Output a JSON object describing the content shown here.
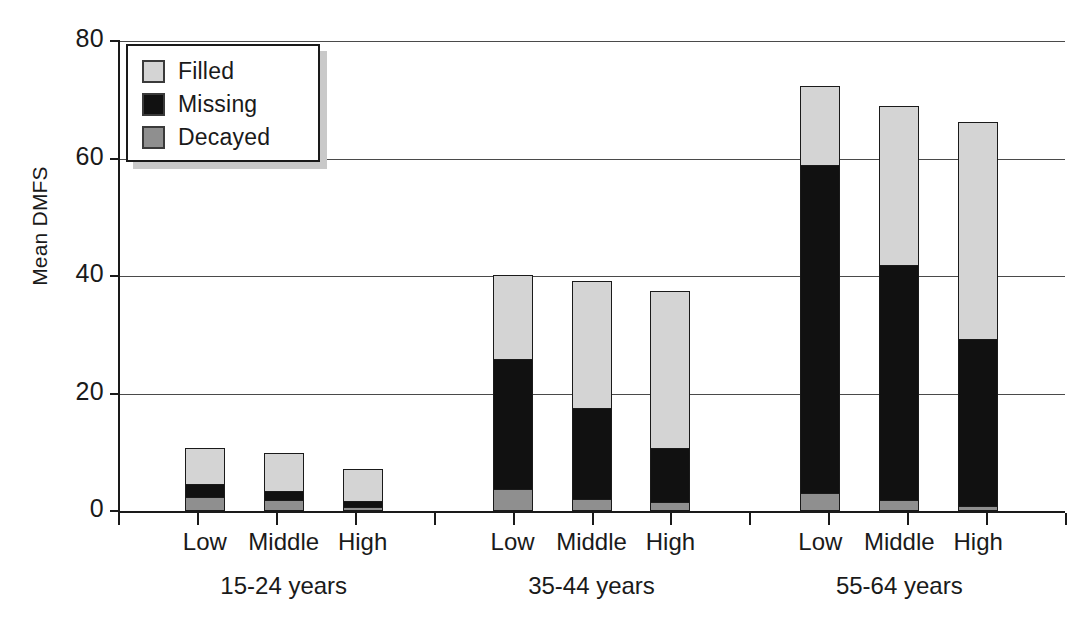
{
  "chart_data": {
    "type": "bar",
    "subtype": "stacked",
    "title": "",
    "xlabel": "",
    "ylabel": "Mean DMFS",
    "ylim": [
      0,
      80
    ],
    "yticks": [
      0,
      20,
      40,
      60,
      80
    ],
    "grid": true,
    "legend_position": "top-left-inside",
    "categories": [
      "Low",
      "Middle",
      "High",
      "Low",
      "Middle",
      "High",
      "Low",
      "Middle",
      "High"
    ],
    "groups": [
      {
        "label": "15-24 years",
        "categories": [
          "Low",
          "Middle",
          "High"
        ]
      },
      {
        "label": "35-44 years",
        "categories": [
          "Low",
          "Middle",
          "High"
        ]
      },
      {
        "label": "55-64 years",
        "categories": [
          "Low",
          "Middle",
          "High"
        ]
      }
    ],
    "series": [
      {
        "name": "Decayed",
        "color": "#8f8f8f",
        "values": [
          2.2,
          1.7,
          0.3,
          3.5,
          1.8,
          1.2,
          2.8,
          1.6,
          0.5
        ]
      },
      {
        "name": "Missing",
        "color": "#111111",
        "values": [
          2.1,
          1.5,
          1.0,
          22.3,
          15.6,
          9.2,
          56.1,
          40.2,
          28.6
        ]
      },
      {
        "name": "Filled",
        "color": "#d4d4d4",
        "values": [
          6.5,
          6.6,
          5.9,
          14.3,
          21.7,
          27.1,
          13.5,
          27.2,
          37.1
        ]
      }
    ],
    "totals": [
      10.8,
      9.8,
      7.2,
      40.1,
      39.1,
      37.5,
      72.4,
      69.0,
      66.2
    ]
  },
  "legend": {
    "items": [
      {
        "label": "Filled",
        "swatch": "filled-swatch"
      },
      {
        "label": "Missing",
        "swatch": "missing-swatch"
      },
      {
        "label": "Decayed",
        "swatch": "decayed-swatch"
      }
    ]
  },
  "axes": {
    "y_title": "Mean DMFS",
    "y_ticks": [
      "80",
      "60",
      "40",
      "20",
      "0"
    ]
  },
  "bars": [
    {
      "id": "b1",
      "group": "15-24 years",
      "category": "Low",
      "decayed": 2.2,
      "missing": 2.1,
      "filled": 6.5
    },
    {
      "id": "b2",
      "group": "15-24 years",
      "category": "Middle",
      "decayed": 1.7,
      "missing": 1.5,
      "filled": 6.6
    },
    {
      "id": "b3",
      "group": "15-24 years",
      "category": "High",
      "decayed": 0.3,
      "missing": 1.0,
      "filled": 5.9
    },
    {
      "id": "b4",
      "group": "35-44 years",
      "category": "Low",
      "decayed": 3.5,
      "missing": 22.3,
      "filled": 14.3
    },
    {
      "id": "b5",
      "group": "35-44 years",
      "category": "Middle",
      "decayed": 1.8,
      "missing": 15.6,
      "filled": 21.7
    },
    {
      "id": "b6",
      "group": "35-44 years",
      "category": "High",
      "decayed": 1.2,
      "missing": 9.2,
      "filled": 27.1
    },
    {
      "id": "b7",
      "group": "55-64 years",
      "category": "Low",
      "decayed": 2.8,
      "missing": 56.1,
      "filled": 13.5
    },
    {
      "id": "b8",
      "group": "55-64 years",
      "category": "Middle",
      "decayed": 1.6,
      "missing": 40.2,
      "filled": 27.2
    },
    {
      "id": "b9",
      "group": "55-64 years",
      "category": "High",
      "decayed": 0.5,
      "missing": 28.6,
      "filled": 37.1
    }
  ],
  "x_labels": [
    "Low",
    "Middle",
    "High",
    "Low",
    "Middle",
    "High",
    "Low",
    "Middle",
    "High"
  ],
  "group_labels": [
    "15-24 years",
    "35-44 years",
    "55-64 years"
  ]
}
